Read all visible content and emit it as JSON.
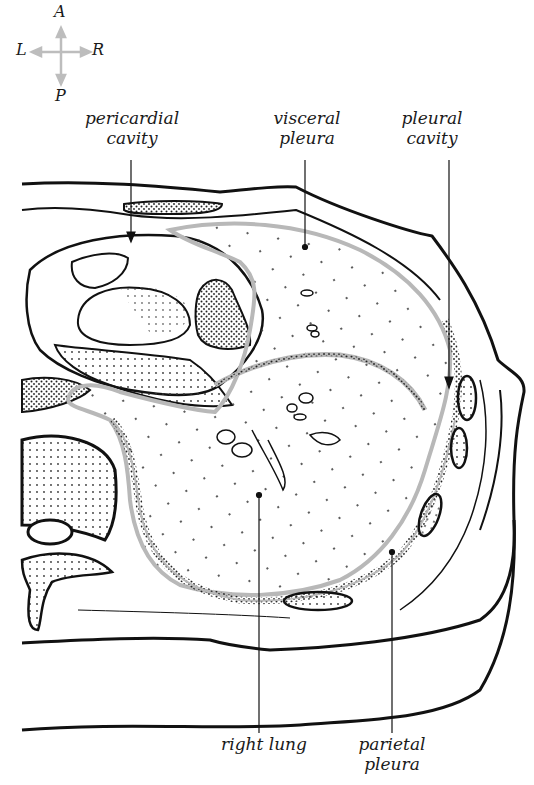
{
  "figure": {
    "compass": {
      "anterior": "A",
      "posterior": "P",
      "left": "L",
      "right": "R",
      "arrow_color": "#bdbdbd"
    },
    "labels": {
      "pericardial_cavity": {
        "line1": "pericardial",
        "line2": "cavity"
      },
      "visceral_pleura": {
        "line1": "visceral",
        "line2": "pleura"
      },
      "pleural_cavity": {
        "line1": "pleural",
        "line2": "cavity"
      },
      "right_lung": {
        "line1": "right lung"
      },
      "parietal_pleura": {
        "line1": "parietal",
        "line2": "pleura"
      }
    },
    "colors": {
      "outline": "#111111",
      "pleura_gray": "#b8b8b8",
      "stipple": "#222222",
      "background": "#ffffff"
    }
  }
}
